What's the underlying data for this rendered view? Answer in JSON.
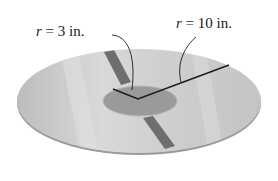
{
  "figure": {
    "type": "washer / disc diagram",
    "labels": {
      "inner_radius": {
        "var": "r",
        "eq": " = ",
        "value": "3 in."
      },
      "outer_radius": {
        "var": "r",
        "eq": " = ",
        "value": "10 in."
      }
    },
    "colors": {
      "disc_fill": "#c9c9c9",
      "disc_edge": "#8a8a8a",
      "stripe": "#6e6e6e",
      "hole": "#ffffff",
      "lines": "#1a1a1a"
    }
  }
}
